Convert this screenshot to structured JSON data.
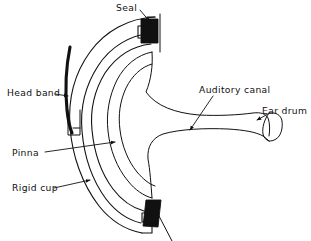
{
  "figure": {
    "type": "line-diagram",
    "background_color": "#ffffff",
    "ink_color": "#111111",
    "width": 311,
    "height": 241
  },
  "labels": {
    "seal": "Seal",
    "head_band": "Head band",
    "pinna": "Pinna",
    "rigid_cup": "Rigid cup",
    "auditory_canal": "Auditory canal",
    "ear_drum": "Ear drum"
  },
  "parts": [
    {
      "key": "seal",
      "label": "Seal",
      "description": "Black filled cushion seal blocks where the cup meets the head, top and bottom",
      "label_x": 137,
      "label_y": 11,
      "leader": "short line sloping down-right to top black seal block",
      "fill_color": "#111111"
    },
    {
      "key": "head_band",
      "label": "Head band",
      "description": "Thick curved arc on the left side attached to the cup by a small bracket",
      "label_x": 8,
      "label_y": 92,
      "leader": "horizontal line to the right ending in an arrowhead on the band arc",
      "fill_color": "#111111"
    },
    {
      "key": "pinna",
      "label": "Pinna",
      "description": "Outer ear enclosed inside the cup cavity",
      "label_x": 12,
      "label_y": 151,
      "leader": "long horizontal line to the right ending in an arrowhead at the pinna outline",
      "fill_color": "none"
    },
    {
      "key": "rigid_cup",
      "label": "Rigid cup",
      "description": "Hard outer shell drawn as nested concentric arcs",
      "label_x": 12,
      "label_y": 188,
      "leader": "line sloping slightly up-right ending in an arrowhead on the outer arc",
      "fill_color": "none"
    },
    {
      "key": "auditory_canal",
      "label": "Auditory canal",
      "description": "Horizontal tube running right from the pinna to the ear drum",
      "label_x": 200,
      "label_y": 90,
      "leader": "diagonal line sloping down-left ending in an arrowhead inside the canal",
      "fill_color": "none"
    },
    {
      "key": "ear_drum",
      "label": "Ear drum",
      "description": "Rounded concave membrane closing the right end of the auditory canal",
      "label_x": 263,
      "label_y": 114,
      "leader": "short line sloping down-left ending in an arrowhead at the drum",
      "fill_color": "none"
    }
  ]
}
